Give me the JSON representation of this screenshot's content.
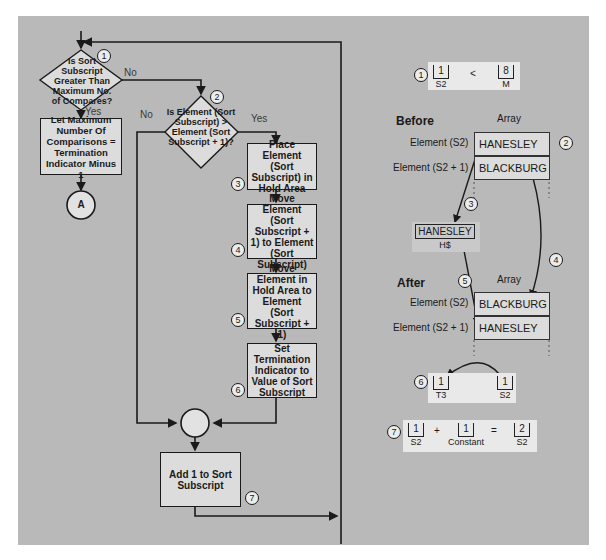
{
  "flowchart": {
    "decision1": {
      "step": "1",
      "text": "Is Sort Subscript Greater Than Maximum No. of Compares?",
      "yes": "Yes",
      "no": "No"
    },
    "process_max": {
      "text": "Let Maximum Number Of Comparisons = Termination Indicator Minus 1"
    },
    "connector_a": {
      "label": "A"
    },
    "decision2": {
      "step": "2",
      "text": "Is Element (Sort Subscript) > Element (Sort Subscript + 1)?",
      "yes": "Yes",
      "no": "No"
    },
    "step3": {
      "step": "3",
      "text": "Place Element (Sort Subscript) in Hold Area"
    },
    "step4": {
      "step": "4",
      "text": "Move Element (Sort Subscript + 1) to Element (Sort Subscript)"
    },
    "step5": {
      "step": "5",
      "text": "Move Element in Hold Area to Element (Sort Subscript + 1)"
    },
    "step6": {
      "step": "6",
      "text": "Set Termination Indicator to Value of Sort Subscript"
    },
    "step7": {
      "step": "7",
      "text": "Add 1 to Sort Subscript"
    }
  },
  "illustration": {
    "compare": {
      "step": "1",
      "left_value": "1",
      "left_label": "S2",
      "operator": "<",
      "right_value": "8",
      "right_label": "M"
    },
    "before": {
      "title": "Before",
      "array_label": "Array",
      "rows": [
        {
          "label": "Element (S2)",
          "value": "HANESLEY"
        },
        {
          "label": "Element (S2 + 1)",
          "value": "BLACKBURG"
        }
      ],
      "step": "2"
    },
    "hold": {
      "step": "3",
      "value": "HANESLEY",
      "label": "H$"
    },
    "after": {
      "title": "After",
      "array_label": "Array",
      "step4": "4",
      "step5": "5",
      "rows": [
        {
          "label": "Element (S2)",
          "value": "BLACKBURG"
        },
        {
          "label": "Element (S2 + 1)",
          "value": "HANESLEY"
        }
      ]
    },
    "assign": {
      "step": "6",
      "target_value": "1",
      "target_label": "T3",
      "source_value": "1",
      "source_label": "S2"
    },
    "add": {
      "step": "7",
      "a_value": "1",
      "a_label": "S2",
      "plus": "+",
      "b_value": "1",
      "b_label": "Constant",
      "equals": "=",
      "result_value": "2",
      "result_label": "S2"
    }
  },
  "colors": {
    "panel": "#b9b9b9",
    "box": "#dcdcdc",
    "line": "#1a1a1a"
  }
}
